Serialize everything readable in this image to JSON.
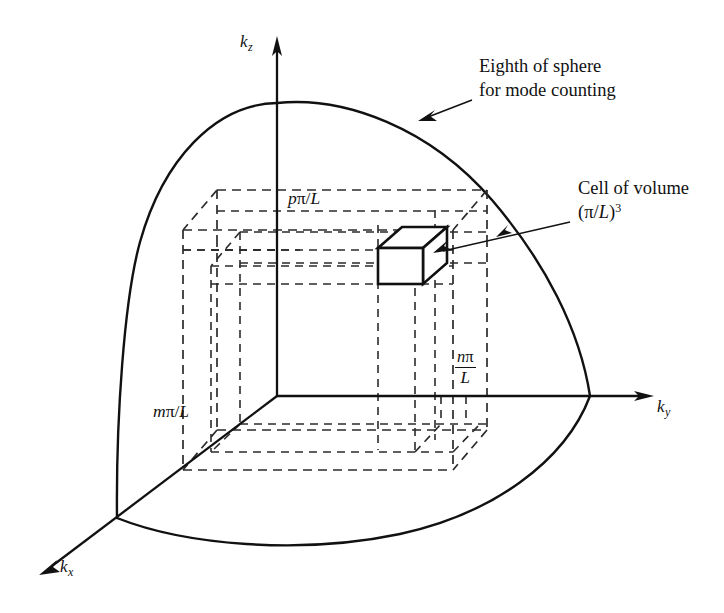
{
  "figure": {
    "kind": "3d-line-diagram",
    "background_color": "#ffffff",
    "ink_color": "#111111",
    "dashed_ink_color": "#2b2b2b"
  },
  "axes": [
    {
      "id": "kz",
      "label_base": "k",
      "label_sub": "z",
      "direction": "up",
      "tip_x": 278,
      "tip_y": 38,
      "label_x": 243,
      "label_y": 40
    },
    {
      "id": "ky",
      "label_base": "k",
      "label_sub": "y",
      "direction": "right",
      "tip_x": 653,
      "tip_y": 396,
      "label_x": 659,
      "label_y": 404
    },
    {
      "id": "kx",
      "label_base": "k",
      "label_sub": "x",
      "direction": "down-left",
      "tip_x": 40,
      "tip_y": 573,
      "label_x": 62,
      "label_y": 567
    }
  ],
  "callouts": [
    {
      "id": "sphere-callout",
      "line1": "Eighth of sphere",
      "line2": "for mode counting",
      "text_x": 479,
      "text_y": 63,
      "arrow_from_x": 472,
      "arrow_from_y": 100,
      "arrow_to_x": 423,
      "arrow_to_y": 119
    },
    {
      "id": "cell-callout",
      "line1": "Cell of volume",
      "line2_prefix": "(",
      "line2_pi": "π",
      "line2_slash": "/",
      "line2_L": "L",
      "line2_suffix": ")",
      "line2_exponent": "3",
      "text_x": 578,
      "text_y": 184,
      "arrow_from_x": 570,
      "arrow_from_y": 222,
      "arrow_to_x": 437,
      "arrow_to_y": 253
    }
  ],
  "dimension_labels": [
    {
      "id": "p-pi-over-L",
      "base": "p",
      "pi": "π",
      "slash": "/",
      "L": "L",
      "x": 288,
      "y": 196
    },
    {
      "id": "m-pi-over-L",
      "base": "m",
      "pi": "π",
      "slash": "/",
      "L": "L",
      "x": 153,
      "y": 409
    },
    {
      "id": "n-pi-over-L-fraction",
      "numerator_base": "n",
      "numerator_pi": "π",
      "denominator": "L",
      "x": 455,
      "y": 352
    }
  ],
  "geometry": {
    "origin": {
      "x": 277,
      "y": 396
    },
    "sphere_radius_note": "eighth-of-sphere octant outline",
    "cell_cube": {
      "front_face": {
        "x": 378,
        "y": 248,
        "w": 45,
        "h": 36
      },
      "depth_dx": 24,
      "depth_dy": -21
    }
  }
}
